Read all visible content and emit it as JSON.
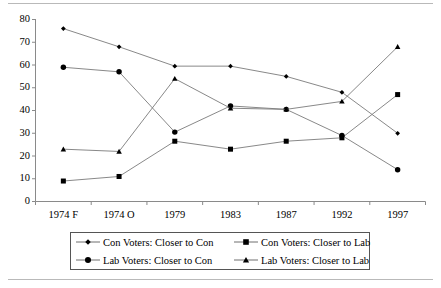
{
  "chart_data": {
    "type": "line",
    "title": "",
    "xlabel": "",
    "ylabel": "",
    "ylim": [
      0,
      80
    ],
    "ytick_step": 10,
    "grid": false,
    "legend_position": "bottom",
    "categories": [
      "1974 F",
      "1974 O",
      "1979",
      "1983",
      "1987",
      "1992",
      "1997"
    ],
    "yticks": [
      "0",
      "10",
      "20",
      "30",
      "40",
      "50",
      "60",
      "70",
      "80"
    ],
    "series": [
      {
        "name": "Con Voters: Closer to Con",
        "marker": "diamond",
        "values": [
          76,
          68,
          59.5,
          59.5,
          55,
          48,
          30
        ]
      },
      {
        "name": "Con Voters: Closer to Lab",
        "marker": "square",
        "values": [
          9,
          11,
          26.5,
          23,
          26.5,
          28,
          47
        ]
      },
      {
        "name": "Lab Voters: Closer to Con",
        "marker": "circle",
        "values": [
          59,
          57,
          30.5,
          42,
          40.5,
          29,
          14
        ]
      },
      {
        "name": "Lab Voters: Closer to Lab",
        "marker": "triangle",
        "values": [
          23,
          22,
          54,
          41,
          40.5,
          44,
          68
        ]
      }
    ]
  },
  "legend": {
    "items": [
      {
        "label": "Con Voters: Closer to Con",
        "marker": "diamond"
      },
      {
        "label": "Con Voters: Closer to Lab",
        "marker": "square"
      },
      {
        "label": "Lab Voters: Closer to Con",
        "marker": "circle"
      },
      {
        "label": "Lab Voters: Closer to Lab",
        "marker": "triangle"
      }
    ]
  }
}
